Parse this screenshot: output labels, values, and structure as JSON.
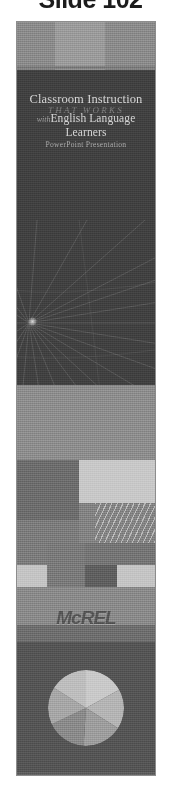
{
  "header": {
    "caption": "Slide 102"
  },
  "slide": {
    "title_line_1": "Classroom Instruction",
    "title_line_2": "THAT WORKS",
    "title_line_3_prefix": "with",
    "title_line_3": "English Language Learners",
    "title_line_4": "PowerPoint Presentation",
    "logo_text": "McREL",
    "colors": {
      "page_background": "#ffffff",
      "caption_text": "#1c1c1c",
      "slide_background": "#6e6e6e",
      "top_band": "#8b8b8b",
      "top_band_square": "#9b9b9b",
      "dark_panel": "#414141",
      "title_text": "#d6d6d6",
      "script_text": "#7e7e7e",
      "subtitle_text": "#a8a8a8",
      "mid_band": "#8d8d8d",
      "block_light": "#c8c8c8",
      "block_mid": "#838383",
      "block_dark": "#5f5f5f",
      "logo_text": "#555555",
      "bottom_band": "#555555"
    }
  },
  "chart_data": {
    "type": "pie",
    "title": "",
    "categories": [
      "Segment 1",
      "Segment 2",
      "Segment 3",
      "Segment 4",
      "Segment 5",
      "Segment 6"
    ],
    "values": [
      17,
      17,
      17,
      17,
      16,
      16
    ],
    "slice_colors": [
      "#c9c9c9",
      "#b4b4b4",
      "#9d9d9d",
      "#8a8a8a",
      "#a6a6a6",
      "#bdbdbd"
    ],
    "legend_position": "none",
    "grid": false
  }
}
